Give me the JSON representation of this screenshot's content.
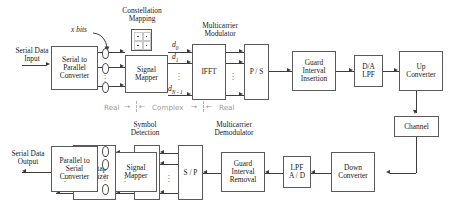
{
  "diagram": {
    "annotations": {
      "constellation_mapping": "Constellation\nMapping",
      "multicarrier_modulator": "Multicarrier\nModulator",
      "symbol_detection": "Symbol\nDetection",
      "multicarrier_demodulator": "Multicarrier\nDemodulator",
      "x_bits": "x bits",
      "serial_data_input": "Serial Data\nInput",
      "serial_data_output": "Serial Data\nOutput"
    },
    "domain_strip": {
      "real_left": "Real",
      "arrow_right": "→",
      "arrow_left": "←",
      "complex": "Complex",
      "real_right": "Real"
    },
    "signal_labels": {
      "d0": "d",
      "d0_sub": "0",
      "d1": "d",
      "d1_sub": "1",
      "dn": "d",
      "dn_sub": "N - 1",
      "dots": "⋮"
    },
    "transmitter": [
      {
        "id": "serial-to-parallel-converter",
        "label": "Serial to\nParallel\nConverter"
      },
      {
        "id": "signal-mapper-tx",
        "label": "Signal\nMapper"
      },
      {
        "id": "ifft",
        "label": "IFFT"
      },
      {
        "id": "parallel-to-serial",
        "label": "P / S"
      },
      {
        "id": "guard-interval-insertion",
        "label": "Guard\nInterval\nInsertion"
      },
      {
        "id": "da-lpf",
        "label": "D/A\nLPF"
      },
      {
        "id": "up-converter",
        "label": "Up\nConverter"
      }
    ],
    "channel": {
      "id": "channel",
      "label": "Channel"
    },
    "receiver": [
      {
        "id": "down-converter",
        "label": "Down\nConverter"
      },
      {
        "id": "lpf-ad",
        "label": "LPF\nA / D"
      },
      {
        "id": "guard-interval-removal",
        "label": "Guard\nInterval\nRemoval"
      },
      {
        "id": "serial-to-parallel-rx",
        "label": "S / P"
      },
      {
        "id": "fft",
        "label": "FFT"
      },
      {
        "id": "one-tap-equalizer",
        "label": "One-tap\nEqualizer"
      },
      {
        "id": "signal-mapper-rx",
        "label": "Signal\nMapper"
      },
      {
        "id": "parallel-to-serial-converter",
        "label": "Parallel to\nSerial\nConverter"
      }
    ],
    "colors": {
      "block_border": "#5a5a5a",
      "line": "#3d3d3d",
      "text": "#1a1a1a",
      "annotation_gray": "#9a9a9a",
      "background": "#ffffff"
    }
  }
}
